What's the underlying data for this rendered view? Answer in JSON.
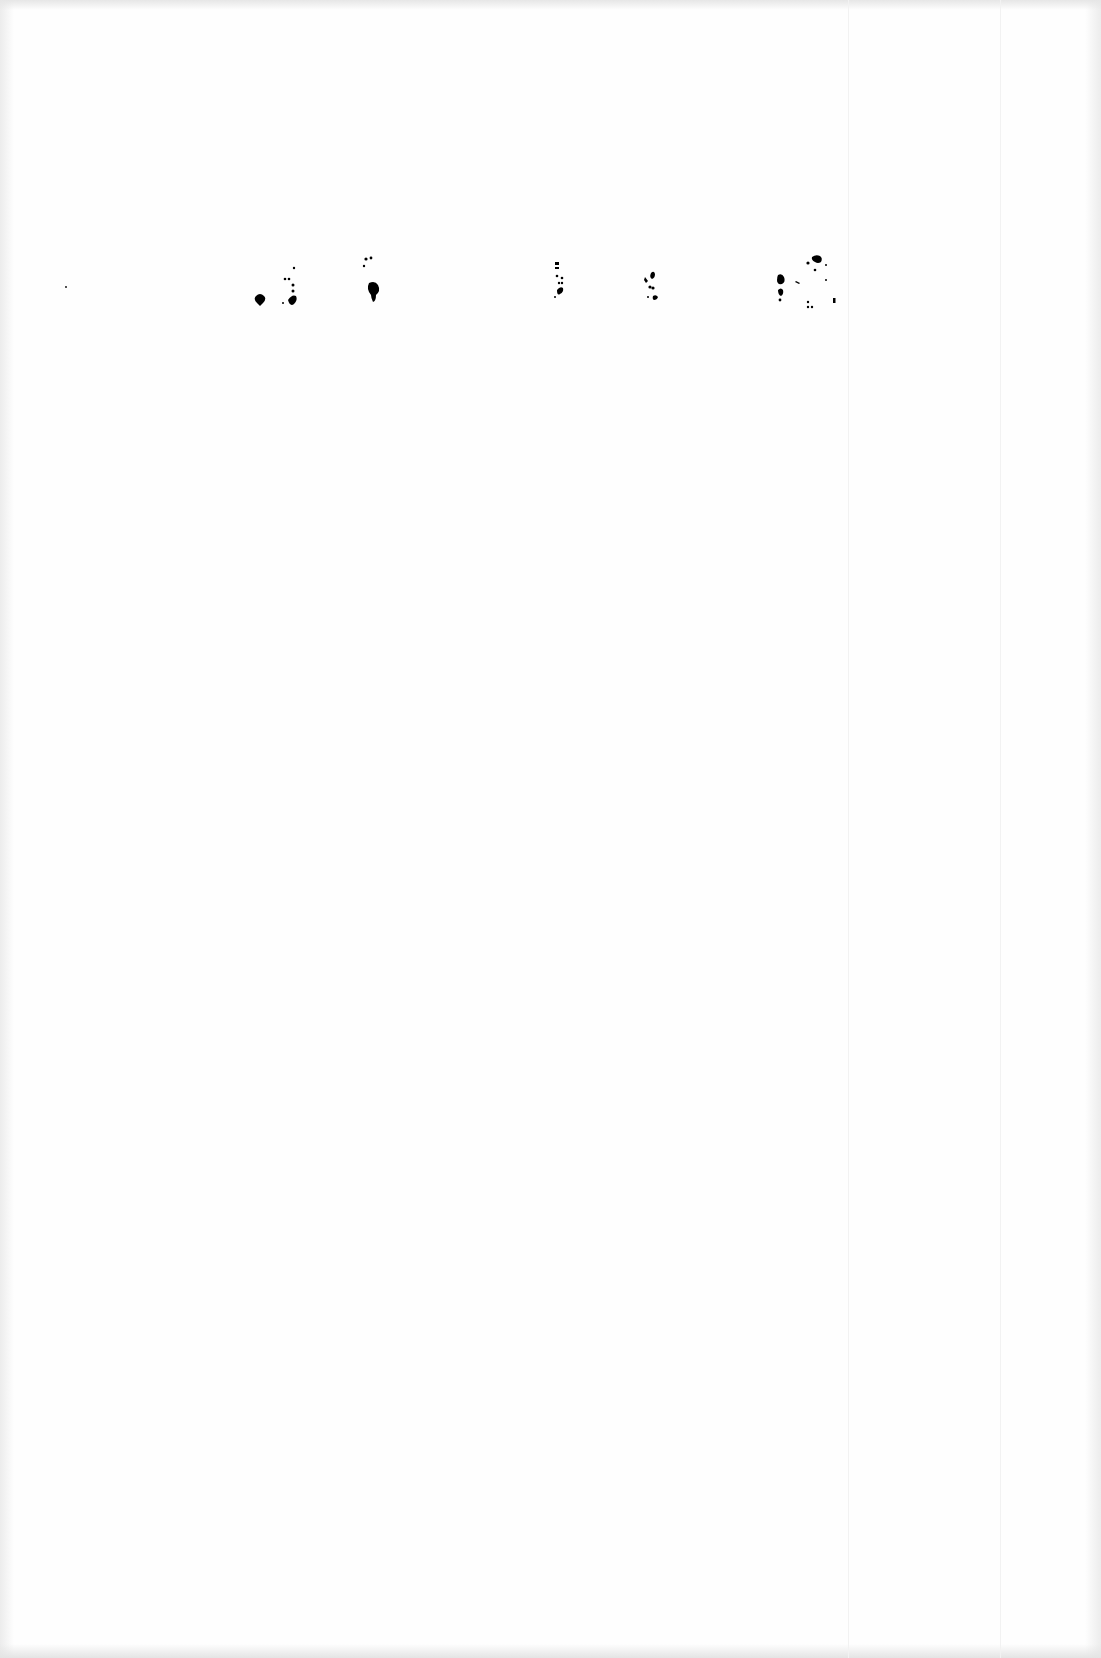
{
  "document": {
    "type": "scanned-page",
    "visible_text": "",
    "description": "Nearly blank scanned page with scattered ink speckles near the top"
  },
  "speckle_clusters": [
    {
      "x": 262,
      "y": 298
    },
    {
      "x": 291,
      "y": 290
    },
    {
      "x": 373,
      "y": 280
    },
    {
      "x": 558,
      "y": 272
    },
    {
      "x": 652,
      "y": 272
    },
    {
      "x": 742,
      "y": 268
    },
    {
      "x": 783,
      "y": 255
    }
  ],
  "colors": {
    "paper": "#fefefe",
    "ink": "#000000",
    "scan_edge": "#e6e6e6"
  }
}
